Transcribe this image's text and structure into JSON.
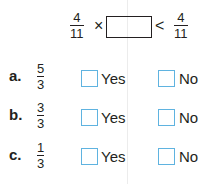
{
  "equation": {
    "left_fraction": {
      "numerator": "4",
      "denominator": "11"
    },
    "operator": "×",
    "comparison": "<",
    "right_fraction": {
      "numerator": "4",
      "denominator": "11"
    }
  },
  "options": [
    {
      "label": "a.",
      "fraction": {
        "numerator": "5",
        "denominator": "3"
      },
      "yes": "Yes",
      "no": "No"
    },
    {
      "label": "b.",
      "fraction": {
        "numerator": "3",
        "denominator": "3"
      },
      "yes": "Yes",
      "no": "No"
    },
    {
      "label": "c.",
      "fraction": {
        "numerator": "1",
        "denominator": "3"
      },
      "yes": "Yes",
      "no": "No"
    }
  ],
  "colors": {
    "checkbox_border": "#5fb3e0",
    "text": "#231f20"
  }
}
